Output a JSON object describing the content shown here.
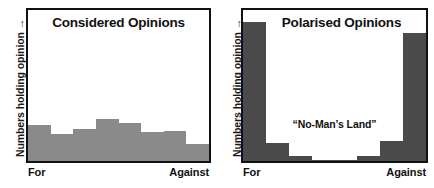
{
  "figure": {
    "background_color": "#ffffff",
    "frame_color": "#111111"
  },
  "panels": [
    {
      "id": "considered",
      "title": "Considered Opinions",
      "ylabel": "Numbers holding opinion →",
      "axis_start_label": "For",
      "axis_end_label": "Against",
      "bar_color": "#8a8a8a",
      "annotation": ""
    },
    {
      "id": "polarised",
      "title": "Polarised Opinions",
      "ylabel": "Numbers holding opinion →",
      "axis_start_label": "For",
      "axis_end_label": "Against",
      "bar_color": "#4a4a4a",
      "annotation": "“No-Man’s Land”"
    }
  ],
  "chart_data": [
    {
      "type": "bar",
      "title": "Considered Opinions",
      "xlabel": "",
      "ylabel": "Numbers holding opinion →",
      "categories": [
        "For",
        "2",
        "3",
        "4",
        "5",
        "6",
        "7",
        "Against"
      ],
      "tick_labels": [
        "For",
        "",
        "",
        "",
        "",
        "",
        "",
        "Against"
      ],
      "values": [
        24,
        18,
        21,
        28,
        25,
        19,
        20,
        11
      ],
      "ylim": [
        0,
        100
      ],
      "grid": false,
      "legend": false,
      "bar_color": "#8a8a8a",
      "annotations": []
    },
    {
      "type": "bar",
      "title": "Polarised Opinions",
      "xlabel": "",
      "ylabel": "Numbers holding opinion →",
      "categories": [
        "For",
        "2",
        "3",
        "4",
        "5",
        "6",
        "7",
        "Against"
      ],
      "tick_labels": [
        "For",
        "",
        "",
        "",
        "",
        "",
        "",
        "Against"
      ],
      "values": [
        92,
        12,
        3,
        1,
        1,
        3,
        13,
        85
      ],
      "ylim": [
        0,
        100
      ],
      "grid": false,
      "legend": false,
      "bar_color": "#4a4a4a",
      "annotations": [
        {
          "text": "“No-Man’s Land”",
          "x_frac": 0.5,
          "y_frac": 0.3
        }
      ]
    }
  ]
}
